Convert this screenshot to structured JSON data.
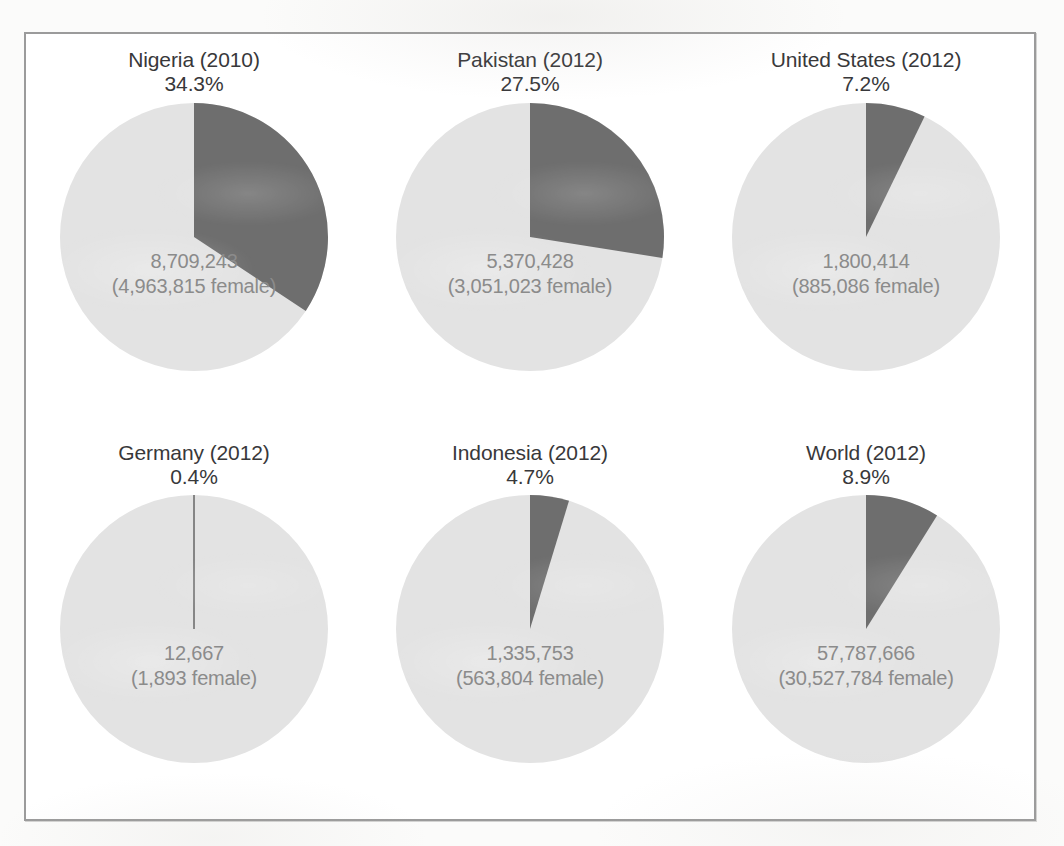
{
  "figure": {
    "background_color": "#ffffff",
    "page_color": "#fbfbfa",
    "border_color": "#9b9b9b",
    "slice_color": "#6e6e6e",
    "remainder_color": "#e3e3e3",
    "title_color": "#38383a",
    "value_color": "#8b8b8b"
  },
  "chart_data": {
    "type": "pie",
    "title": "",
    "subtitle": "",
    "layout": {
      "rows": 2,
      "columns": 3,
      "start_angle_deg": 0,
      "direction": "clockwise",
      "legend": "none",
      "grid": false
    },
    "series_names": [
      "highlighted share",
      "remainder"
    ],
    "charts": [
      {
        "title": "Nigeria (2010)",
        "percent_label": "34.3%",
        "percent": 34.3,
        "remainder_percent": 65.7,
        "total_label": "8,709,243",
        "total": 8709243,
        "female_label": "(4,963,815 female)",
        "female": 4963815
      },
      {
        "title": "Pakistan (2012)",
        "percent_label": "27.5%",
        "percent": 27.5,
        "remainder_percent": 72.5,
        "total_label": "5,370,428",
        "total": 5370428,
        "female_label": "(3,051,023 female)",
        "female": 3051023
      },
      {
        "title": "United States (2012)",
        "percent_label": "7.2%",
        "percent": 7.2,
        "remainder_percent": 92.8,
        "total_label": "1,800,414",
        "total": 1800414,
        "female_label": "(885,086 female)",
        "female": 885086
      },
      {
        "title": "Germany (2012)",
        "percent_label": "0.4%",
        "percent": 0.4,
        "remainder_percent": 99.6,
        "total_label": "12,667",
        "total": 12667,
        "female_label": "(1,893 female)",
        "female": 1893
      },
      {
        "title": "Indonesia (2012)",
        "percent_label": "4.7%",
        "percent": 4.7,
        "remainder_percent": 95.3,
        "total_label": "1,335,753",
        "total": 1335753,
        "female_label": "(563,804 female)",
        "female": 563804
      },
      {
        "title": "World (2012)",
        "percent_label": "8.9%",
        "percent": 8.9,
        "remainder_percent": 91.1,
        "total_label": "57,787,666",
        "total": 57787666,
        "female_label": "(30,527,784 female)",
        "female": 30527784
      }
    ]
  }
}
